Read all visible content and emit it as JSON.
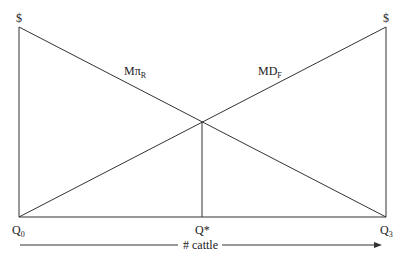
{
  "diagram": {
    "y_axis_left_label": "$",
    "y_axis_right_label": "$",
    "curves": [
      {
        "name": "Mπ",
        "subscript": "R",
        "direction": "decreasing"
      },
      {
        "name": "MD",
        "subscript": "F",
        "direction": "increasing"
      }
    ],
    "x_labels": {
      "left": {
        "main": "Q",
        "sub": "0"
      },
      "middle": {
        "main": "Q*"
      },
      "right": {
        "main": "Q",
        "sub": "3"
      }
    },
    "x_axis_caption": "# cattle"
  }
}
